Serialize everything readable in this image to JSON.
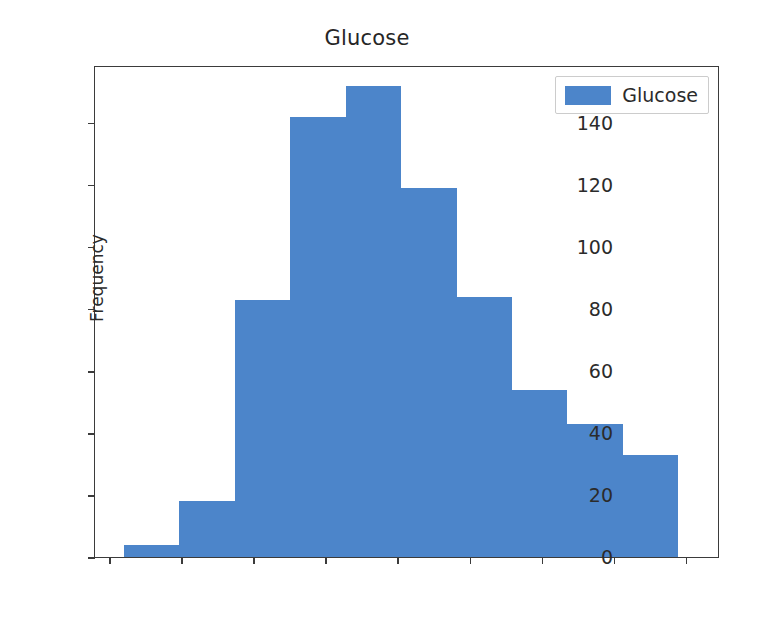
{
  "chart_data": {
    "type": "bar",
    "title": "Glucose",
    "xlabel": "",
    "ylabel": "Frequency",
    "legend": [
      {
        "name": "Glucose",
        "color": "#4c85ca"
      }
    ],
    "legend_position": "upper right",
    "grid": false,
    "xlim": [
      36,
      209
    ],
    "ylim": [
      0,
      158
    ],
    "xticks": [
      40,
      60,
      80,
      100,
      120,
      140,
      160,
      180,
      200
    ],
    "yticks": [
      0,
      20,
      40,
      60,
      80,
      100,
      120,
      140
    ],
    "xtick_labels": [
      "40",
      "60",
      "80",
      "100",
      "120",
      "140",
      "160",
      "180",
      "200"
    ],
    "ytick_labels": [
      "0",
      "20",
      "40",
      "60",
      "80",
      "100",
      "120",
      "140"
    ],
    "bin_edges": [
      44,
      59.4,
      74.8,
      90.2,
      105.6,
      121,
      136.4,
      151.8,
      167.2,
      182.6,
      198
    ],
    "categories": [
      "44-59",
      "59-75",
      "75-90",
      "90-106",
      "106-121",
      "121-136",
      "136-152",
      "152-167",
      "167-183",
      "183-198"
    ],
    "values": [
      4,
      18,
      83,
      142,
      152,
      119,
      84,
      54,
      43,
      33
    ],
    "bars": [
      {
        "x0": 44.0,
        "x1": 59.4,
        "value": 4
      },
      {
        "x0": 59.4,
        "x1": 74.8,
        "value": 18
      },
      {
        "x0": 74.8,
        "x1": 90.2,
        "value": 83
      },
      {
        "x0": 90.2,
        "x1": 105.6,
        "value": 142
      },
      {
        "x0": 105.6,
        "x1": 121.0,
        "value": 152
      },
      {
        "x0": 121.0,
        "x1": 136.4,
        "value": 119
      },
      {
        "x0": 136.4,
        "x1": 151.8,
        "value": 84
      },
      {
        "x0": 151.8,
        "x1": 167.2,
        "value": 54
      },
      {
        "x0": 167.2,
        "x1": 182.6,
        "value": 43
      },
      {
        "x0": 182.6,
        "x1": 198.0,
        "value": 33
      }
    ]
  },
  "colors": {
    "bar": "#4c85ca",
    "axis": "#3b3b3b",
    "text": "#2b2b2b",
    "background": "#ffffff"
  }
}
